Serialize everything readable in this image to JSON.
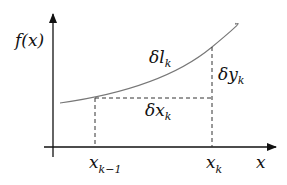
{
  "diagram": {
    "y_axis_label": "f(x)",
    "x_axis_label": "x",
    "arc_label": {
      "main": "δl",
      "sub": "k"
    },
    "dy_label": {
      "main": "δy",
      "sub": "k"
    },
    "dx_label": {
      "main": "δx",
      "sub": "k"
    },
    "tick_left": {
      "main": "x",
      "sub": "k−1"
    },
    "tick_right": {
      "main": "x",
      "sub": "k"
    },
    "colors": {
      "axis": "#111111",
      "curve": "#777777",
      "dashed": "#333333",
      "background": "#ffffff"
    }
  }
}
